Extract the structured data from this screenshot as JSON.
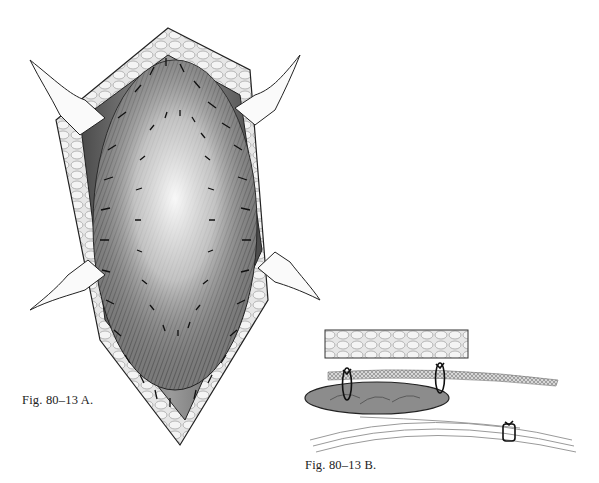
{
  "figure": {
    "panel_a": {
      "caption": "Fig. 80–13 A.",
      "description": "Surgical wound opened with four retractors; mesh sutured into oval defect with interrupted sutures"
    },
    "panel_b": {
      "caption": "Fig. 80–13 B.",
      "description": "Cross-section showing tissue layers with mesh and sutures"
    },
    "colors": {
      "ink": "#1a1a1a",
      "shade_dark": "#555555",
      "shade_mid": "#8a8a8a",
      "shade_light": "#c8c8c8",
      "background": "#ffffff"
    }
  }
}
